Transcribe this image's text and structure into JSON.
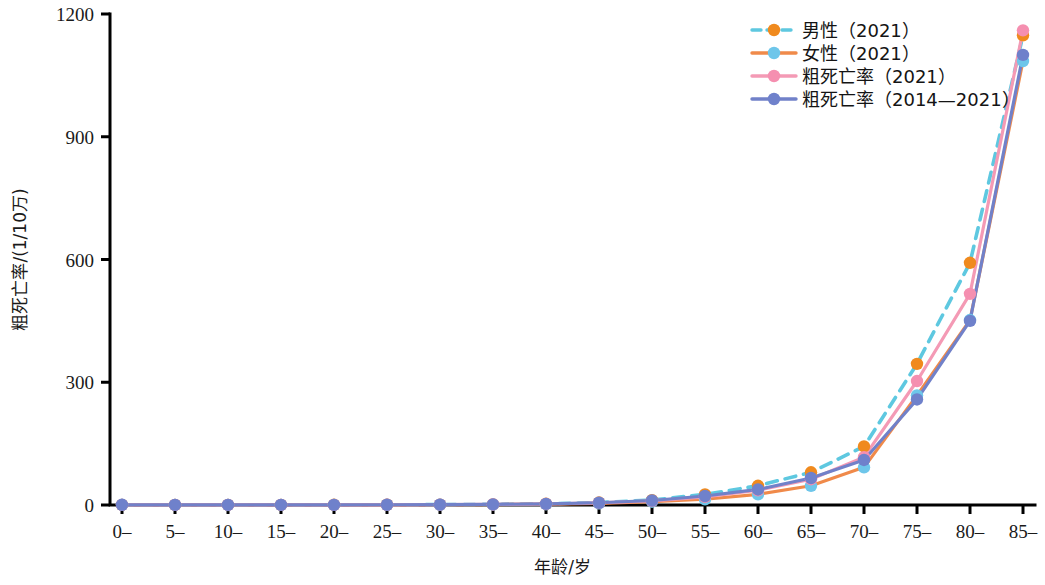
{
  "chart_data": {
    "type": "line",
    "title": "",
    "xlabel": "年龄/岁",
    "ylabel": "粗死亡率/(1/10万)",
    "categories": [
      "0–",
      "5–",
      "10–",
      "15–",
      "20–",
      "25–",
      "30–",
      "35–",
      "40–",
      "45–",
      "50–",
      "55–",
      "60–",
      "65–",
      "70–",
      "75–",
      "80–",
      "85–"
    ],
    "xlim": [
      0,
      17
    ],
    "ylim": [
      0,
      1200
    ],
    "yticks": [
      0,
      300,
      600,
      900,
      1200
    ],
    "grid": false,
    "legend_position": "top-right",
    "series": [
      {
        "name": "男性（2021）",
        "line_color": "#5ec8e0",
        "marker_color": "#f08a1e",
        "line_style": "dashed",
        "values": [
          0.4,
          0.2,
          0.2,
          0.3,
          0.5,
          0.6,
          0.9,
          1.6,
          3.0,
          6.0,
          12,
          26,
          47,
          80,
          143,
          345,
          592,
          1148
        ]
      },
      {
        "name": "女性（2021）",
        "line_color": "#f08a4a",
        "marker_color": "#6ec6ea",
        "line_style": "solid",
        "values": [
          0.3,
          0.2,
          0.1,
          0.2,
          0.3,
          0.4,
          0.6,
          1.0,
          2.0,
          4.0,
          8,
          14,
          26,
          47,
          92,
          268,
          452,
          1085
        ]
      },
      {
        "name": "粗死亡率（2021）",
        "line_color": "#f49ab5",
        "marker_color": "#f58fb0",
        "line_style": "solid",
        "values": [
          0.4,
          0.2,
          0.2,
          0.2,
          0.4,
          0.5,
          0.8,
          1.3,
          2.5,
          5.0,
          10,
          20,
          36,
          63,
          117,
          303,
          516,
          1160
        ]
      },
      {
        "name": "粗死亡率（2014—2021）",
        "line_color": "#7181c9",
        "marker_color": "#6f81cb",
        "line_style": "solid",
        "values": [
          0.5,
          0.3,
          0.2,
          0.3,
          0.4,
          0.6,
          0.9,
          1.5,
          2.8,
          5.5,
          11,
          22,
          38,
          66,
          110,
          258,
          450,
          1100
        ]
      }
    ]
  },
  "axes": {
    "x_tick_labels": [
      "0–",
      "5–",
      "10–",
      "15–",
      "20–",
      "25–",
      "30–",
      "35–",
      "40–",
      "45–",
      "50–",
      "55–",
      "60–",
      "65–",
      "70–",
      "75–",
      "80–",
      "85–"
    ],
    "y_tick_labels": [
      "0",
      "300",
      "600",
      "900",
      "1200"
    ],
    "x_axis_title": "年龄/岁",
    "y_axis_title": "粗死亡率/(1/10万)"
  },
  "legend": {
    "items": [
      {
        "label": "男性（2021）"
      },
      {
        "label": "女性（2021）"
      },
      {
        "label": "粗死亡率（2021）"
      },
      {
        "label": "粗死亡率（2014—2021）"
      }
    ]
  }
}
